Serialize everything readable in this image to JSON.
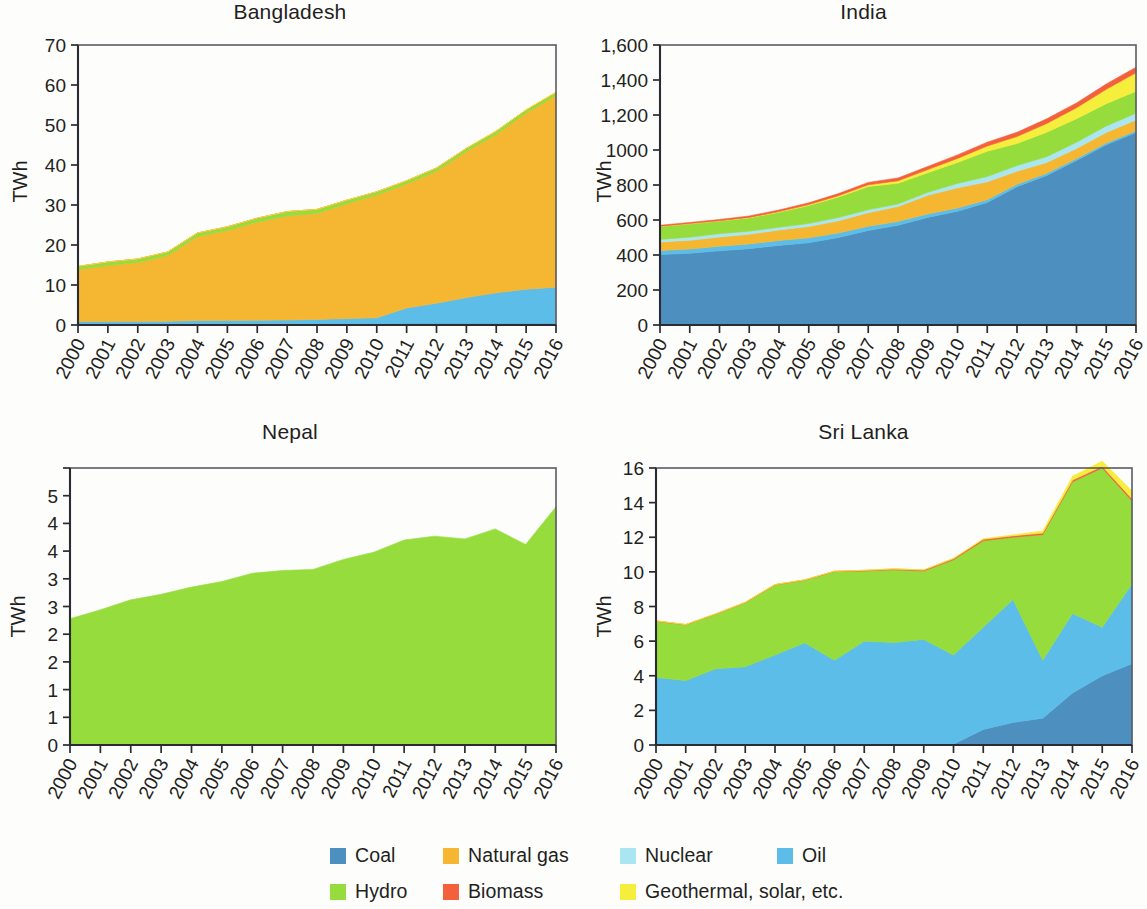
{
  "figure": {
    "ylabel": "TWh",
    "years": [
      "2000",
      "2001",
      "2002",
      "2003",
      "2004",
      "2005",
      "2006",
      "2007",
      "2008",
      "2009",
      "2010",
      "2011",
      "2012",
      "2013",
      "2014",
      "2015",
      "2016"
    ]
  },
  "legend": {
    "items": [
      {
        "label": "Coal",
        "color": "#4d8fbf"
      },
      {
        "label": "Natural gas",
        "color": "#f5b731"
      },
      {
        "label": "Nuclear",
        "color": "#a9e6f2"
      },
      {
        "label": "Oil",
        "color": "#5cbde8"
      },
      {
        "label": "Hydro",
        "color": "#96dc3c"
      },
      {
        "label": "Biomass",
        "color": "#f4603c"
      },
      {
        "label": "Geothermal, solar, etc.",
        "color": "#f6ee3c"
      }
    ]
  },
  "panels": [
    {
      "title": "Bangladesh",
      "ylabel": "TWh",
      "yticks": [
        "0",
        "10",
        "20",
        "30",
        "40",
        "50",
        "60",
        "70"
      ]
    },
    {
      "title": "India",
      "ylabel": "TWh",
      "yticks": [
        "0",
        "200",
        "400",
        "600",
        "800",
        "1000",
        "1,200",
        "1,400",
        "1,600"
      ]
    },
    {
      "title": "Nepal",
      "ylabel": "TWh",
      "yticks": [
        "0",
        "1",
        "1",
        "2",
        "2",
        "3",
        "3",
        "4",
        "4",
        "5"
      ]
    },
    {
      "title": "Sri Lanka",
      "ylabel": "TWh",
      "yticks": [
        "0",
        "2",
        "4",
        "6",
        "8",
        "10",
        "12",
        "14",
        "16"
      ]
    }
  ],
  "chart_data": [
    {
      "type": "area",
      "title": "Bangladesh",
      "xlabel": "",
      "ylabel": "TWh",
      "ylim": [
        0,
        70
      ],
      "ytick_values": [
        0,
        10,
        20,
        30,
        40,
        50,
        60,
        70
      ],
      "grid": false,
      "legend_position": "bottom",
      "x": [
        "2000",
        "2001",
        "2002",
        "2003",
        "2004",
        "2005",
        "2006",
        "2007",
        "2008",
        "2009",
        "2010",
        "2011",
        "2012",
        "2013",
        "2014",
        "2015",
        "2016"
      ],
      "series": [
        {
          "name": "Coal",
          "color": "#4d8fbf",
          "values": [
            0.35,
            0.35,
            0.35,
            0.35,
            0.4,
            0.4,
            0.4,
            0.4,
            0.4,
            0.4,
            0.4,
            0.45,
            0.45,
            0.45,
            0.45,
            0.45,
            0.45
          ]
        },
        {
          "name": "Oil",
          "color": "#5cbde8",
          "values": [
            0.5,
            0.5,
            0.55,
            0.6,
            0.7,
            0.75,
            0.8,
            0.85,
            1.0,
            1.2,
            1.4,
            3.8,
            5.0,
            6.4,
            7.6,
            8.5,
            9.0
          ]
        },
        {
          "name": "Natural gas",
          "color": "#f5b731",
          "values": [
            13.0,
            14.0,
            14.7,
            16.4,
            21.0,
            22.5,
            24.5,
            26.0,
            26.5,
            28.7,
            30.7,
            31.0,
            33.0,
            36.5,
            39.6,
            44.0,
            47.9
          ]
        },
        {
          "name": "Hydro",
          "color": "#96dc3c",
          "values": [
            0.8,
            0.9,
            0.9,
            0.9,
            0.9,
            0.9,
            1.0,
            1.1,
            1.0,
            0.9,
            0.8,
            0.8,
            0.8,
            0.8,
            0.8,
            0.8,
            0.8
          ]
        },
        {
          "name": "Biomass",
          "color": "#f4603c",
          "values": [
            0,
            0,
            0,
            0,
            0,
            0,
            0,
            0,
            0,
            0,
            0,
            0,
            0,
            0,
            0,
            0,
            0
          ]
        },
        {
          "name": "Geothermal, solar, etc.",
          "color": "#f6ee3c",
          "values": [
            0,
            0,
            0,
            0,
            0,
            0,
            0,
            0,
            0,
            0,
            0,
            0,
            0,
            0,
            0.05,
            0.08,
            0.1
          ]
        }
      ]
    },
    {
      "type": "area",
      "title": "India",
      "xlabel": "",
      "ylabel": "TWh",
      "ylim": [
        0,
        1600
      ],
      "ytick_values": [
        0,
        200,
        400,
        600,
        800,
        1000,
        1200,
        1400,
        1600
      ],
      "grid": false,
      "legend_position": "bottom",
      "x": [
        "2000",
        "2001",
        "2002",
        "2003",
        "2004",
        "2005",
        "2006",
        "2007",
        "2008",
        "2009",
        "2010",
        "2011",
        "2012",
        "2013",
        "2014",
        "2015",
        "2016"
      ],
      "series": [
        {
          "name": "Coal",
          "color": "#4d8fbf",
          "values": [
            403,
            410,
            424,
            436,
            455,
            470,
            500,
            540,
            570,
            615,
            650,
            700,
            790,
            855,
            940,
            1030,
            1100
          ]
        },
        {
          "name": "Oil",
          "color": "#5cbde8",
          "values": [
            23,
            24,
            26,
            27,
            28,
            28,
            26,
            24,
            22,
            20,
            18,
            16,
            14,
            12,
            11,
            10,
            10
          ]
        },
        {
          "name": "Natural gas",
          "color": "#f5b731",
          "values": [
            48,
            50,
            53,
            56,
            60,
            65,
            70,
            78,
            85,
            106,
            116,
            102,
            75,
            62,
            58,
            60,
            62
          ]
        },
        {
          "name": "Nuclear",
          "color": "#a9e6f2",
          "values": [
            15,
            18,
            19,
            17,
            16,
            17,
            18,
            17,
            15,
            17,
            25,
            30,
            32,
            33,
            35,
            37,
            38
          ]
        },
        {
          "name": "Hydro",
          "color": "#96dc3c",
          "values": [
            75,
            76,
            72,
            76,
            85,
            103,
            117,
            132,
            118,
            112,
            120,
            145,
            126,
            140,
            135,
            128,
            126
          ]
        },
        {
          "name": "Geothermal, solar, etc.",
          "color": "#f6ee3c",
          "values": [
            1,
            2,
            2,
            3,
            4,
            5,
            8,
            10,
            14,
            18,
            23,
            30,
            40,
            50,
            62,
            82,
            105
          ]
        },
        {
          "name": "Biomass",
          "color": "#f4603c",
          "values": [
            5,
            6,
            7,
            8,
            9,
            10,
            12,
            14,
            16,
            18,
            20,
            22,
            24,
            26,
            28,
            30,
            32
          ]
        }
      ]
    },
    {
      "type": "area",
      "title": "Nepal",
      "xlabel": "",
      "ylabel": "TWh",
      "ylim": [
        0,
        5
      ],
      "ytick_values": [
        0,
        0.5,
        1,
        1.5,
        2,
        2.5,
        3,
        3.5,
        4,
        4.5,
        5
      ],
      "grid": false,
      "legend_position": "bottom",
      "x": [
        "2000",
        "2001",
        "2002",
        "2003",
        "2004",
        "2005",
        "2006",
        "2007",
        "2008",
        "2009",
        "2010",
        "2011",
        "2012",
        "2013",
        "2014",
        "2015",
        "2016"
      ],
      "series": [
        {
          "name": "Hydro",
          "color": "#96dc3c",
          "values": [
            2.28,
            2.44,
            2.62,
            2.72,
            2.85,
            2.95,
            3.1,
            3.15,
            3.17,
            3.35,
            3.48,
            3.7,
            3.77,
            3.72,
            3.9,
            3.62,
            4.3
          ]
        }
      ]
    },
    {
      "type": "area",
      "title": "Sri Lanka",
      "xlabel": "",
      "ylabel": "TWh",
      "ylim": [
        0,
        16
      ],
      "ytick_values": [
        0,
        2,
        4,
        6,
        8,
        10,
        12,
        14,
        16
      ],
      "grid": false,
      "legend_position": "bottom",
      "x": [
        "2000",
        "2001",
        "2002",
        "2003",
        "2004",
        "2005",
        "2006",
        "2007",
        "2008",
        "2009",
        "2010",
        "2011",
        "2012",
        "2013",
        "2014",
        "2015",
        "2016"
      ],
      "series": [
        {
          "name": "Coal",
          "color": "#4d8fbf",
          "values": [
            0,
            0,
            0,
            0,
            0,
            0,
            0,
            0,
            0,
            0,
            0.05,
            0.9,
            1.3,
            1.55,
            3.0,
            4.0,
            4.7
          ]
        },
        {
          "name": "Oil",
          "color": "#5cbde8",
          "values": [
            3.9,
            3.72,
            4.4,
            4.52,
            5.2,
            5.9,
            4.9,
            6.0,
            5.92,
            6.1,
            5.15,
            5.9,
            7.1,
            3.35,
            4.6,
            2.8,
            4.6
          ]
        },
        {
          "name": "Hydro",
          "color": "#96dc3c",
          "values": [
            3.25,
            3.22,
            3.15,
            3.7,
            4.05,
            3.62,
            5.12,
            4.05,
            4.2,
            3.95,
            5.5,
            5.0,
            3.6,
            7.25,
            7.6,
            9.2,
            4.8
          ]
        },
        {
          "name": "Biomass",
          "color": "#f4603c",
          "values": [
            0.02,
            0.02,
            0.02,
            0.02,
            0.02,
            0.02,
            0.02,
            0.04,
            0.05,
            0.06,
            0.07,
            0.08,
            0.08,
            0.09,
            0.1,
            0.1,
            0.12
          ]
        },
        {
          "name": "Geothermal, solar, etc.",
          "color": "#f6ee3c",
          "values": [
            0,
            0,
            0,
            0,
            0,
            0,
            0,
            0,
            0,
            0,
            0,
            0.03,
            0.06,
            0.12,
            0.22,
            0.3,
            0.45
          ]
        }
      ]
    }
  ]
}
